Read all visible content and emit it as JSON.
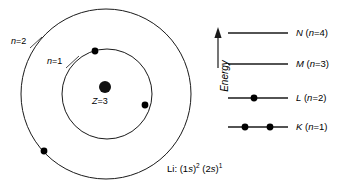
{
  "figure": {
    "colors": {
      "stroke": "#1a1a1a",
      "electron": "#000000",
      "nucleus": "#111111",
      "background": "#ffffff"
    }
  },
  "atom_diagram": {
    "shells": [
      {
        "id": "shell-outer",
        "label_html": "<span class=\"it\">n</span><span class=\"up\">=2</span>",
        "quantum_number": 2,
        "electron_count": 1
      },
      {
        "id": "shell-inner",
        "label_html": "<span class=\"it\">n</span><span class=\"up\">=1</span>",
        "quantum_number": 1,
        "electron_count": 2
      }
    ],
    "nucleus": {
      "label_html": "<span class=\"it\">Z</span><span class=\"up\">=3</span>",
      "atomic_number": 3
    },
    "caption_html": "Li: (1<span class=\"it\">s</span>)<span class=\"sup\">2</span> (2<span class=\"it\">s</span>)<span class=\"sup\">1</span>",
    "caption_text": "Li: (1s)2 (2s)1"
  },
  "energy_diagram": {
    "axis_label": "Energy",
    "axis_direction": "increasing upward",
    "levels": [
      {
        "id": "level-N",
        "shell": "N",
        "n": 4,
        "label_html": "<span class=\"it\">N</span> (<span class=\"it\">n</span>=4)",
        "label_text": "N (n=4)",
        "electrons": 0
      },
      {
        "id": "level-M",
        "shell": "M",
        "n": 3,
        "label_html": "<span class=\"it\">M</span> (<span class=\"it\">n</span>=3)",
        "label_text": "M (n=3)",
        "electrons": 0
      },
      {
        "id": "level-L",
        "shell": "L",
        "n": 2,
        "label_html": "<span class=\"it\">L</span> (<span class=\"it\">n</span>=2)",
        "label_text": "L (n=2)",
        "electrons": 1
      },
      {
        "id": "level-K",
        "shell": "K",
        "n": 1,
        "label_html": "<span class=\"it\">K</span> (<span class=\"it\">n</span>=1)",
        "label_text": "K (n=1)",
        "electrons": 2
      }
    ]
  }
}
